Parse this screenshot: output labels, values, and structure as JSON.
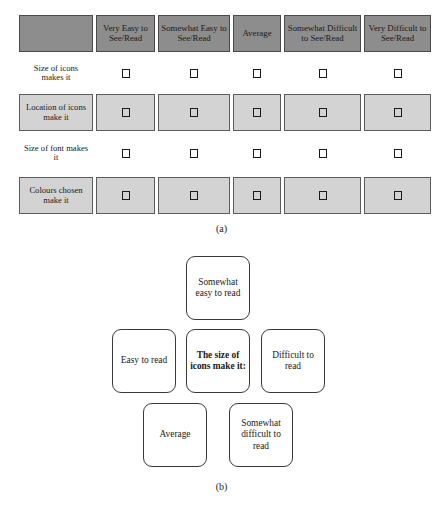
{
  "panel_a": {
    "caption": "(a)",
    "header": {
      "label_blank": "",
      "columns": [
        "Very Easy to See/Read",
        "Somewhat Easy to See/Read",
        "Average",
        "Somewhat Difficult to See/Read",
        "Very Difficult to See/Read"
      ]
    },
    "rows": [
      {
        "label": "Size of icons makes it",
        "shaded": false,
        "checkboxes": [
          false,
          false,
          false,
          false,
          false
        ]
      },
      {
        "label": "Location of icons make it",
        "shaded": true,
        "checkboxes": [
          false,
          false,
          false,
          false,
          false
        ]
      },
      {
        "label": "Size of font makes it",
        "shaded": false,
        "checkboxes": [
          false,
          false,
          false,
          false,
          false
        ]
      },
      {
        "label": "Colours chosen make it",
        "shaded": true,
        "checkboxes": [
          false,
          false,
          false,
          false,
          false
        ]
      }
    ]
  },
  "panel_b": {
    "caption": "(b)",
    "center_node": "The size of icons make it:",
    "nodes": [
      {
        "position": "top",
        "label": "Somewhat easy to read"
      },
      {
        "position": "left",
        "label": "Easy to read"
      },
      {
        "position": "right",
        "label": "Difficult to read"
      },
      {
        "position": "bottom-left",
        "label": "Average"
      },
      {
        "position": "bottom-right",
        "label": "Somewhat difficult to read"
      }
    ]
  },
  "colors": {
    "header_grey": "#8d8d8d",
    "row_grey": "#d3d3d3",
    "border": "#4a4a4a",
    "page": "#ffffff",
    "text": "#1a1a1a"
  }
}
